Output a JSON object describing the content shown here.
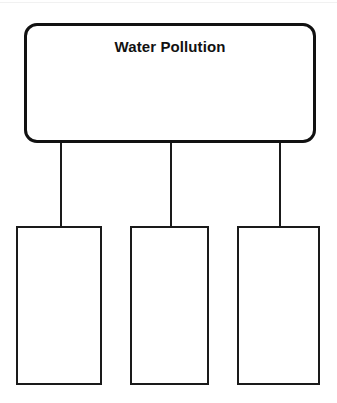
{
  "page": {
    "width": 337,
    "height": 403,
    "background_color": "#ffffff",
    "ink_color": "#111111",
    "type": "graphic-organizer-worksheet"
  },
  "topic": {
    "title": "Water Pollution",
    "shape": "rounded-rectangle",
    "filled": false
  },
  "connectors": [
    {
      "from": "topic",
      "to": "detail-box-1"
    },
    {
      "from": "topic",
      "to": "detail-box-2"
    },
    {
      "from": "topic",
      "to": "detail-box-3"
    }
  ],
  "details": [
    {
      "label": "",
      "placeholder": ""
    },
    {
      "label": "",
      "placeholder": ""
    },
    {
      "label": "",
      "placeholder": ""
    }
  ]
}
